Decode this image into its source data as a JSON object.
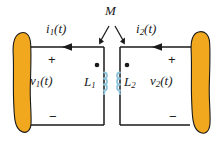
{
  "figure": {
    "type": "circuit-diagram",
    "background_color": "#ffffff",
    "wire_color": "#1a1a1a",
    "coil_color": "#8fc4dd",
    "source_fill_color": "#f2a81e",
    "source_outline_color": "#1a1a1a"
  },
  "labels": {
    "current_left": {
      "base": "i",
      "sub": "1",
      "arg": "(t)"
    },
    "current_right": {
      "base": "i",
      "sub": "2",
      "arg": "(t)"
    },
    "mutual_inductance": "M",
    "voltage_left": {
      "base": "v",
      "sub": "1",
      "arg": "(t)"
    },
    "voltage_right": {
      "base": "v",
      "sub": "2",
      "arg": "(t)"
    },
    "inductor_left": {
      "base": "L",
      "sub": "1"
    },
    "inductor_right": {
      "base": "L",
      "sub": "2"
    }
  },
  "polarity": {
    "left_plus": "+",
    "left_minus": "−",
    "right_plus": "+",
    "right_minus": "−"
  },
  "elements": {
    "left_source_name": "left-source-element",
    "right_source_name": "right-source-element",
    "dot_left_name": "dot-convention-marker-left",
    "dot_right_name": "dot-convention-marker-right"
  }
}
